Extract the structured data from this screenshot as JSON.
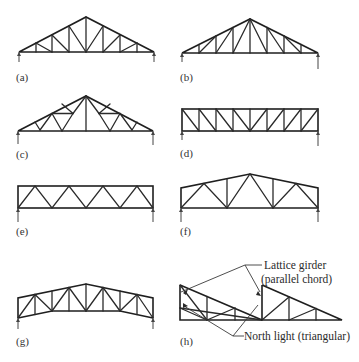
{
  "figure": {
    "panels": [
      {
        "id": "a",
        "label": "(a)",
        "type": "pitched truss (Pratt-type, many panels)"
      },
      {
        "id": "b",
        "label": "(b)",
        "type": "pitched truss (Howe-type fan)"
      },
      {
        "id": "c",
        "label": "(c)",
        "type": "Fink / French truss"
      },
      {
        "id": "d",
        "label": "(d)",
        "type": "parallel chord Pratt girder"
      },
      {
        "id": "e",
        "label": "(e)",
        "type": "parallel chord Warren girder"
      },
      {
        "id": "f",
        "label": "(f)",
        "type": "low pitch Warren truss"
      },
      {
        "id": "g",
        "label": "(g)",
        "type": "low pitch Pratt truss"
      },
      {
        "id": "h",
        "label": "(h)",
        "type": "north light with lattice girder"
      }
    ],
    "annotations": {
      "lattice_girder_line1": "Lattice girder",
      "lattice_girder_line2": "(parallel chord)",
      "north_light": "North light (triangular)"
    }
  }
}
